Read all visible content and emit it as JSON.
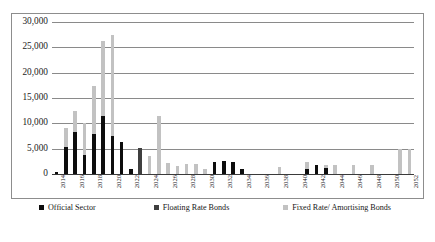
{
  "chart_data": {
    "type": "bar",
    "barmode": "stacked",
    "title": "",
    "subtitle": "",
    "xlabel": "",
    "ylabel": "",
    "ylim": [
      0,
      30000
    ],
    "ytick_values": [
      0,
      5000,
      10000,
      15000,
      20000,
      25000,
      30000
    ],
    "ytick_labels": [
      "0",
      "5,000",
      "10,000",
      "15,000",
      "20,000",
      "25,000",
      "30,000"
    ],
    "grid": true,
    "grid_axis": "y",
    "legend_position": "bottom",
    "categories": [
      "2014",
      "2015",
      "2016",
      "2017",
      "2018",
      "2019",
      "2020",
      "2021",
      "2022",
      "2023",
      "2024",
      "2025",
      "2026",
      "2027",
      "2028",
      "2029",
      "2030",
      "2031",
      "2032",
      "2033",
      "2034",
      "2035",
      "2036",
      "2037",
      "2038",
      "2039",
      "2040",
      "2041",
      "2042",
      "2043",
      "2044",
      "2045",
      "2046",
      "2047",
      "2048",
      "2049",
      "2050",
      "2051",
      "2052"
    ],
    "xtick_labels": [
      "2014",
      "2016",
      "2018",
      "2020",
      "2022",
      "2024",
      "2026",
      "2028",
      "2030",
      "2032",
      "2034",
      "2036",
      "2038",
      "2040",
      "2042",
      "2044",
      "2046",
      "2048",
      "2050",
      "2052"
    ],
    "series": [
      {
        "name": "Official Sector",
        "color": "#0d0d0d",
        "values": [
          300,
          5400,
          8300,
          3700,
          7900,
          11500,
          7500,
          6400,
          1000,
          0,
          0,
          0,
          0,
          0,
          0,
          0,
          0,
          2400,
          2600,
          2300,
          900,
          0,
          0,
          0,
          0,
          0,
          0,
          1000,
          1800,
          1100,
          0,
          0,
          0,
          0,
          0,
          0,
          0,
          0,
          0
        ]
      },
      {
        "name": "Floating Rate Bonds",
        "color": "#3f3f3f",
        "values": [
          0,
          0,
          0,
          0,
          0,
          0,
          0,
          0,
          0,
          5200,
          0,
          0,
          0,
          0,
          0,
          0,
          0,
          0,
          0,
          0,
          0,
          0,
          0,
          0,
          0,
          0,
          0,
          0,
          0,
          0,
          0,
          0,
          0,
          0,
          0,
          0,
          0,
          0,
          0
        ]
      },
      {
        "name": "Fixed Rate/ Amortising Bonds",
        "color": "#c2c2c2",
        "values": [
          0,
          3700,
          4100,
          6400,
          9400,
          14800,
          19900,
          0,
          0,
          0,
          3500,
          11500,
          2200,
          1600,
          2000,
          1900,
          1000,
          0,
          0,
          0,
          0,
          0,
          0,
          0,
          1400,
          0,
          0,
          1300,
          0,
          700,
          1700,
          0,
          1700,
          0,
          1700,
          0,
          0,
          4900,
          4900
        ]
      }
    ]
  },
  "legend": {
    "items": [
      {
        "label": "Official Sector",
        "swatch": "official"
      },
      {
        "label": "Floating Rate Bonds",
        "swatch": "floating"
      },
      {
        "label": "Fixed Rate/ Amortising Bonds",
        "swatch": "fixed"
      }
    ]
  }
}
